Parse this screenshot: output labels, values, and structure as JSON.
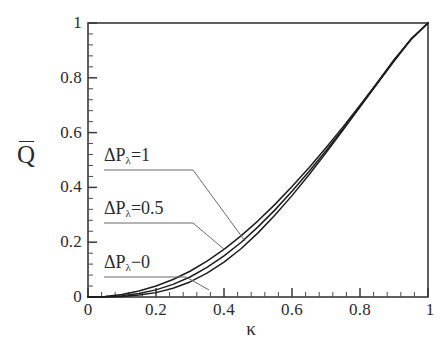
{
  "figure": {
    "width": 444,
    "height": 347,
    "background": "#ffffff",
    "frame_color": "#3a3a3a",
    "curve_color": "#1d1d1d",
    "leader_color": "#6b6b6b"
  },
  "axes": {
    "x": {
      "title": "κ",
      "ticks": [
        "0",
        "0.2",
        "0.4",
        "0.6",
        "0.8",
        "1"
      ],
      "tick_values": [
        0,
        0.2,
        0.4,
        0.6,
        0.8,
        1
      ],
      "range": [
        0,
        1
      ],
      "minor_per_major": 4
    },
    "y": {
      "title": "Q",
      "title_overbar": true,
      "ticks": [
        "0",
        "0.2",
        "0.4",
        "0.6",
        "0.8",
        "1"
      ],
      "tick_values": [
        0,
        0.2,
        0.4,
        0.6,
        0.8,
        1
      ],
      "range": [
        0,
        1
      ],
      "minor_per_major": 4
    }
  },
  "annotations": [
    {
      "id": "annot-1",
      "prefix": "ΔP",
      "sub": "λ",
      "suffix": "=1"
    },
    {
      "id": "annot-05",
      "prefix": "ΔP",
      "sub": "λ",
      "suffix": "=0.5"
    },
    {
      "id": "annot-0",
      "prefix": "ΔP",
      "sub": "λ",
      "suffix": "−0"
    }
  ],
  "chart_data": {
    "type": "line",
    "title": "",
    "subtitle": "",
    "xlabel": "κ",
    "ylabel": "Q̄",
    "xlim": [
      0,
      1
    ],
    "ylim": [
      0,
      1
    ],
    "grid": false,
    "legend": "annotations with leader lines inside plot",
    "xticks": [
      0,
      0.2,
      0.4,
      0.6,
      0.8,
      1
    ],
    "yticks": [
      0,
      0.2,
      0.4,
      0.6,
      0.8,
      1
    ],
    "x": [
      0,
      0.05,
      0.1,
      0.15,
      0.2,
      0.25,
      0.3,
      0.35,
      0.4,
      0.45,
      0.5,
      0.55,
      0.6,
      0.65,
      0.7,
      0.75,
      0.8,
      0.85,
      0.9,
      0.95,
      1
    ],
    "series": [
      {
        "name": "ΔPλ=1",
        "label": "ΔP_λ=1",
        "values": [
          0,
          0.002,
          0.009,
          0.022,
          0.04,
          0.064,
          0.094,
          0.131,
          0.174,
          0.223,
          0.278,
          0.338,
          0.403,
          0.472,
          0.545,
          0.621,
          0.7,
          0.781,
          0.863,
          0.942,
          1.0
        ]
      },
      {
        "name": "ΔPλ=0.5",
        "label": "ΔP_λ=0.5",
        "values": [
          0,
          0.001,
          0.005,
          0.013,
          0.026,
          0.046,
          0.073,
          0.108,
          0.15,
          0.199,
          0.256,
          0.318,
          0.386,
          0.458,
          0.534,
          0.613,
          0.694,
          0.777,
          0.86,
          0.94,
          1.0
        ]
      },
      {
        "name": "ΔPλ−0",
        "label": "ΔP_λ=0",
        "values": [
          0,
          0.0,
          0.002,
          0.007,
          0.016,
          0.032,
          0.055,
          0.087,
          0.127,
          0.176,
          0.234,
          0.299,
          0.37,
          0.446,
          0.526,
          0.609,
          0.694,
          0.78,
          0.866,
          0.94,
          1.0
        ]
      }
    ]
  }
}
